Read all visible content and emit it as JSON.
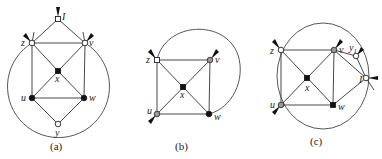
{
  "figure": {
    "panels": [
      {
        "caption": "(a)",
        "vertices": {
          "I": {
            "label": "I",
            "type": "white"
          },
          "z": {
            "label": "z",
            "type": "white"
          },
          "v": {
            "label": "v",
            "type": "white"
          },
          "x": {
            "label": "x",
            "type": "black"
          },
          "u": {
            "label": "u",
            "type": "black"
          },
          "w": {
            "label": "w",
            "type": "black"
          },
          "y": {
            "label": "y",
            "type": "white"
          }
        },
        "edges": [
          [
            "I",
            "z"
          ],
          [
            "I",
            "v"
          ],
          [
            "z",
            "v"
          ],
          [
            "z",
            "x"
          ],
          [
            "v",
            "x"
          ],
          [
            "z",
            "u"
          ],
          [
            "v",
            "w"
          ],
          [
            "x",
            "u"
          ],
          [
            "x",
            "w"
          ],
          [
            "u",
            "w"
          ],
          [
            "u",
            "y"
          ],
          [
            "w",
            "y"
          ]
        ],
        "outer_curve": "circle through z, v, y"
      },
      {
        "caption": "(b)",
        "vertices": {
          "z": {
            "label": "z",
            "type": "white"
          },
          "v": {
            "label": "v",
            "type": "gray"
          },
          "x": {
            "label": "x",
            "type": "black"
          },
          "u": {
            "label": "u",
            "type": "gray"
          },
          "w": {
            "label": "w",
            "type": "black"
          }
        },
        "edges": [
          [
            "z",
            "v"
          ],
          [
            "z",
            "x"
          ],
          [
            "v",
            "x"
          ],
          [
            "z",
            "u"
          ],
          [
            "v",
            "w"
          ],
          [
            "x",
            "u"
          ],
          [
            "x",
            "w"
          ],
          [
            "u",
            "w"
          ]
        ],
        "outer_curve": "arc from z to w"
      },
      {
        "caption": "(c)",
        "vertices": {
          "z": {
            "label": "z",
            "type": "white"
          },
          "v": {
            "label": "v",
            "type": "gray"
          },
          "y1": {
            "label": "y",
            "sub": "1",
            "type": "white"
          },
          "I": {
            "label": "I",
            "type": "white"
          },
          "x": {
            "label": "x",
            "type": "black"
          },
          "u": {
            "label": "u",
            "type": "gray"
          },
          "w": {
            "label": "w",
            "type": "black"
          }
        },
        "edges": [
          [
            "z",
            "v"
          ],
          [
            "z",
            "x"
          ],
          [
            "v",
            "x"
          ],
          [
            "z",
            "u"
          ],
          [
            "v",
            "w"
          ],
          [
            "x",
            "u"
          ],
          [
            "x",
            "w"
          ],
          [
            "u",
            "w"
          ],
          [
            "v",
            "y1"
          ],
          [
            "y1",
            "I"
          ],
          [
            "v",
            "I"
          ],
          [
            "w",
            "I"
          ]
        ],
        "outer_curve": "circle through z, u, I"
      }
    ],
    "colors": {
      "white_vertex": "#ffffff",
      "black_vertex": "#111111",
      "gray_vertex": "#999999",
      "line": "#333333"
    }
  }
}
